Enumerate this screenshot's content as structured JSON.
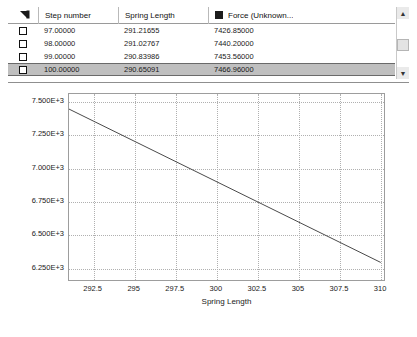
{
  "grid": {
    "corner_icon": "sort-corner-icon",
    "columns": [
      {
        "key": "check",
        "label": ""
      },
      {
        "key": "step",
        "label": "Step number"
      },
      {
        "key": "spring",
        "label": "Spring Length"
      },
      {
        "key": "force",
        "label": "Force (Unknown..."
      }
    ],
    "force_series_color": "#1c1c1c",
    "rows": [
      {
        "step": "97.00000",
        "spring": "291.21655",
        "force": "7426.85000",
        "selected": false
      },
      {
        "step": "98.00000",
        "spring": "291.02767",
        "force": "7440.20000",
        "selected": false
      },
      {
        "step": "99.00000",
        "spring": "290.83986",
        "force": "7453.56000",
        "selected": false
      },
      {
        "step": "100.00000",
        "spring": "290.65091",
        "force": "7466.96000",
        "selected": true
      }
    ],
    "scrollbar": {
      "up_arrow": "▲",
      "down_arrow": "▼"
    }
  },
  "chart_data": {
    "type": "line",
    "title": "",
    "xlabel": "Spring Length",
    "ylabel": "",
    "xlim": [
      291.0,
      310.3
    ],
    "ylim": [
      6150,
      7560
    ],
    "xticks": [
      292.5,
      295,
      297.5,
      300,
      302.5,
      305,
      307.5,
      310
    ],
    "xticklabels": [
      "292.5",
      "295",
      "297.5",
      "300",
      "302.5",
      "305",
      "307.5",
      "310"
    ],
    "yticks": [
      7500,
      7250,
      7000,
      6750,
      6500,
      6250
    ],
    "yticklabels": [
      "7.500E+3",
      "7.250E+3",
      "7.000E+3",
      "6.750E+3",
      "6.500E+3",
      "6.250E+3"
    ],
    "grid": true,
    "legend": "none",
    "series": [
      {
        "name": "Force (Unknown...",
        "color": "#4a4a4a",
        "marker_at_start": true,
        "x": [
          290.65091,
          310.1
        ],
        "y": [
          7466.96,
          6283.0
        ],
        "points": [
          {
            "x": 290.65091,
            "y": 7466.96
          },
          {
            "x": 310.1,
            "y": 6283.0
          }
        ]
      }
    ]
  }
}
